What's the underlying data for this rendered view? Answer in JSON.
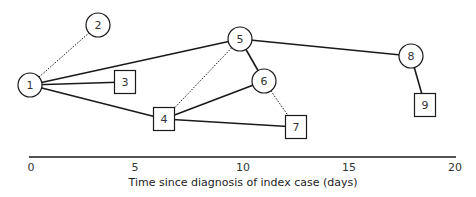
{
  "diagram": {
    "type": "transmission-network",
    "nodes": [
      {
        "id": "1",
        "label": "1",
        "shape": "circle",
        "x": 30,
        "y": 85
      },
      {
        "id": "2",
        "label": "2",
        "shape": "circle",
        "x": 98,
        "y": 25
      },
      {
        "id": "3",
        "label": "3",
        "shape": "square",
        "x": 125,
        "y": 82
      },
      {
        "id": "4",
        "label": "4",
        "shape": "square",
        "x": 164,
        "y": 119
      },
      {
        "id": "5",
        "label": "5",
        "shape": "circle",
        "x": 240,
        "y": 39
      },
      {
        "id": "6",
        "label": "6",
        "shape": "circle",
        "x": 264,
        "y": 81
      },
      {
        "id": "7",
        "label": "7",
        "shape": "square",
        "x": 296,
        "y": 127
      },
      {
        "id": "8",
        "label": "8",
        "shape": "circle",
        "x": 411,
        "y": 56
      },
      {
        "id": "9",
        "label": "9",
        "shape": "square",
        "x": 425,
        "y": 105
      }
    ],
    "edges": [
      {
        "from": "1",
        "to": "2",
        "style": "dotted"
      },
      {
        "from": "1",
        "to": "3",
        "style": "solid"
      },
      {
        "from": "1",
        "to": "4",
        "style": "solid"
      },
      {
        "from": "1",
        "to": "5",
        "style": "solid"
      },
      {
        "from": "5",
        "to": "4",
        "style": "dotted"
      },
      {
        "from": "5",
        "to": "6",
        "style": "solid"
      },
      {
        "from": "5",
        "to": "8",
        "style": "solid"
      },
      {
        "from": "6",
        "to": "4",
        "style": "solid"
      },
      {
        "from": "6",
        "to": "7",
        "style": "dotted"
      },
      {
        "from": "4",
        "to": "7",
        "style": "solid"
      },
      {
        "from": "8",
        "to": "9",
        "style": "solid"
      }
    ],
    "axis": {
      "title": "Time since diagnosis of index case (days)",
      "ticks": [
        {
          "label": "0",
          "x": 31
        },
        {
          "label": "5",
          "x": 135
        },
        {
          "label": "10",
          "x": 243
        },
        {
          "label": "15",
          "x": 349
        },
        {
          "label": "20",
          "x": 455
        }
      ],
      "range": [
        0,
        20
      ]
    },
    "colors": {
      "stroke": "#1a1a1a",
      "fill": "#ffffff",
      "text": "#333333"
    }
  }
}
